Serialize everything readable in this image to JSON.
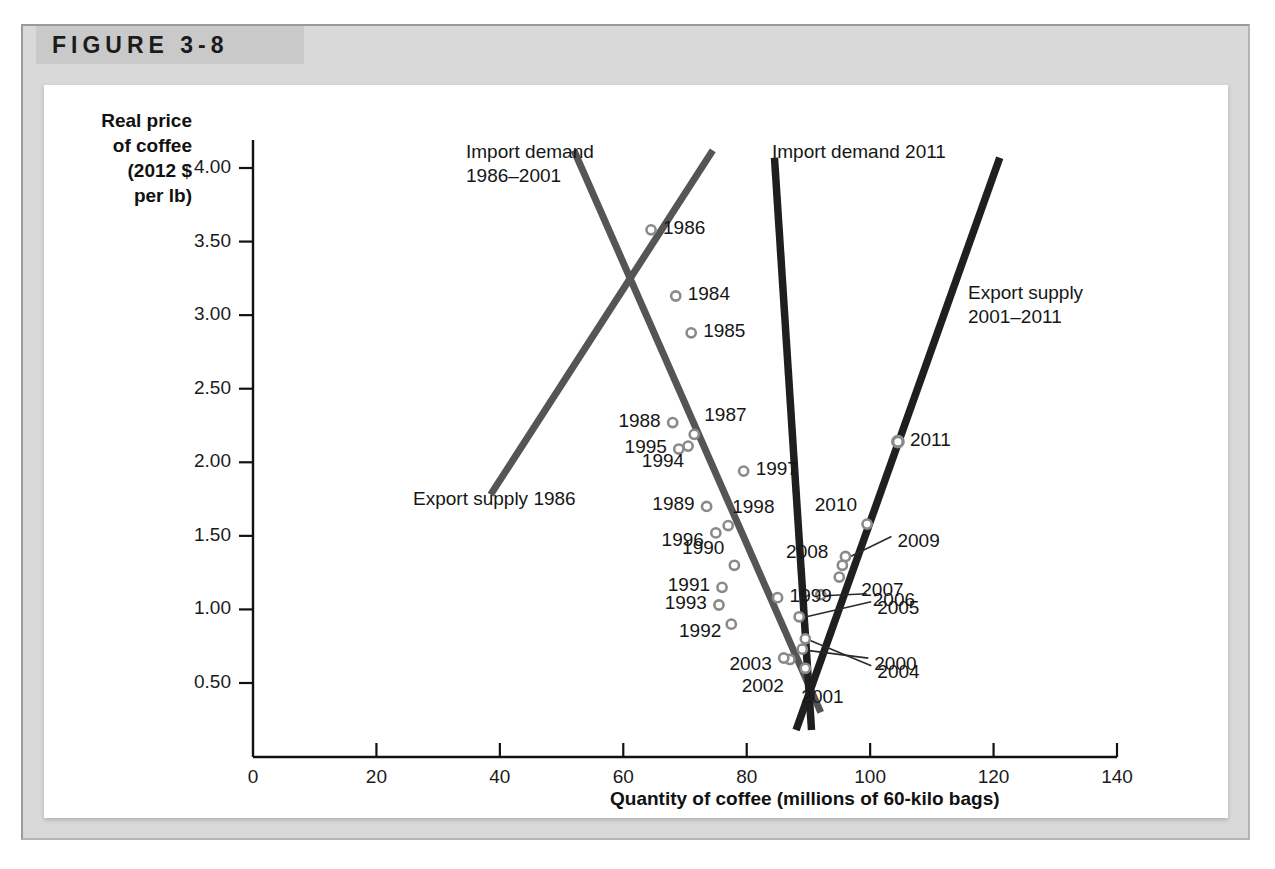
{
  "figure": {
    "number": "FIGURE 3-8"
  },
  "axes": {
    "y_title": "Real price\nof coffee\n(2012 $\nper lb)",
    "x_title": "Quantity of coffee (millions of 60-kilo bags)",
    "y_ticks": [
      "0.50",
      "1.00",
      "1.50",
      "2.00",
      "2.50",
      "3.00",
      "3.50",
      "4.00"
    ],
    "x_ticks": [
      "0",
      "20",
      "40",
      "60",
      "80",
      "100",
      "120",
      "140"
    ]
  },
  "curve_labels": {
    "import_demand_old": "Import demand\n1986–2001",
    "import_demand_2011": "Import demand 2011",
    "export_supply_1986": "Export supply 1986",
    "export_supply_new": "Export supply\n2001–2011"
  },
  "colors": {
    "frame": "#d9d9d9",
    "tab": "#c9c9c9",
    "panel": "#ffffff",
    "axis": "#111111",
    "curve_gray": "#555555",
    "curve_black": "#1f1f1f",
    "marker_stroke": "#8a8a8a"
  },
  "chart_data": {
    "type": "scatter",
    "title": "FIGURE 3-8",
    "xlabel": "Quantity of coffee (millions of 60-kilo bags)",
    "ylabel": "Real price of coffee (2012 $ per lb)",
    "xlim": [
      0,
      140
    ],
    "ylim": [
      0,
      4.2
    ],
    "grid": false,
    "legend": "none",
    "points": [
      {
        "label": "1984",
        "x": 68.5,
        "y": 3.13
      },
      {
        "label": "1985",
        "x": 71.0,
        "y": 2.88
      },
      {
        "label": "1986",
        "x": 64.5,
        "y": 3.58
      },
      {
        "label": "1987",
        "x": 71.5,
        "y": 2.19
      },
      {
        "label": "1988",
        "x": 68.0,
        "y": 2.27
      },
      {
        "label": "1989",
        "x": 73.5,
        "y": 1.7
      },
      {
        "label": "1990",
        "x": 78.0,
        "y": 1.3
      },
      {
        "label": "1991",
        "x": 76.0,
        "y": 1.15
      },
      {
        "label": "1992",
        "x": 77.5,
        "y": 0.9
      },
      {
        "label": "1993",
        "x": 75.5,
        "y": 1.03
      },
      {
        "label": "1994",
        "x": 70.5,
        "y": 2.11
      },
      {
        "label": "1995",
        "x": 69.0,
        "y": 2.09
      },
      {
        "label": "1996",
        "x": 75.0,
        "y": 1.52
      },
      {
        "label": "1997",
        "x": 79.5,
        "y": 1.94
      },
      {
        "label": "1998",
        "x": 77.0,
        "y": 1.57
      },
      {
        "label": "1999",
        "x": 85.0,
        "y": 1.08
      },
      {
        "label": "2000",
        "x": 89.0,
        "y": 0.73
      },
      {
        "label": "2001",
        "x": 89.5,
        "y": 0.6
      },
      {
        "label": "2002",
        "x": 87.0,
        "y": 0.66
      },
      {
        "label": "2003",
        "x": 86.0,
        "y": 0.67
      },
      {
        "label": "2004",
        "x": 89.5,
        "y": 0.8
      },
      {
        "label": "2005",
        "x": 88.5,
        "y": 0.95
      },
      {
        "label": "2006",
        "x": 92.0,
        "y": 1.1
      },
      {
        "label": "2007",
        "x": 95.0,
        "y": 1.22
      },
      {
        "label": "2008",
        "x": 95.5,
        "y": 1.3
      },
      {
        "label": "2009",
        "x": 96.0,
        "y": 1.36
      },
      {
        "label": "2010",
        "x": 99.5,
        "y": 1.58
      },
      {
        "label": "2011",
        "x": 104.5,
        "y": 2.14
      }
    ],
    "lines": [
      {
        "name": "Export supply 1986",
        "style": "gray",
        "x1": 38.5,
        "y1": 1.78,
        "x2": 74.5,
        "y2": 4.12
      },
      {
        "name": "Import demand 1986-2001",
        "style": "gray",
        "x1": 52.0,
        "y1": 4.12,
        "x2": 92.0,
        "y2": 0.3
      },
      {
        "name": "Import demand 2011",
        "style": "black",
        "x1": 84.5,
        "y1": 4.07,
        "x2": 90.5,
        "y2": 0.18
      },
      {
        "name": "Export supply 2001-2011",
        "style": "black",
        "x1": 88.0,
        "y1": 0.18,
        "x2": 121.0,
        "y2": 4.07
      }
    ]
  }
}
